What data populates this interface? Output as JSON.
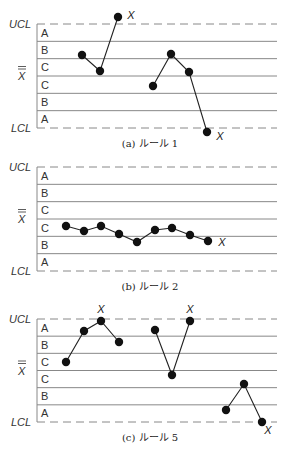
{
  "axis_labels": {
    "ucl": "UCL",
    "center": "X",
    "lcl": "LCL"
  },
  "zones": [
    "A",
    "B",
    "C",
    "C",
    "B",
    "A"
  ],
  "colors": {
    "line": "#888888",
    "point": "#111111",
    "connector": "#222222",
    "text": "#333333"
  },
  "chart_data": [
    {
      "type": "line",
      "title": "(a) ルール 1",
      "caption": "(a)  ルール 1",
      "top": 24,
      "bottom": 128,
      "groups": [
        [
          [
            82,
            55
          ],
          [
            100,
            71
          ],
          [
            118,
            17
          ]
        ],
        [
          [
            153,
            86
          ],
          [
            171,
            54
          ],
          [
            189,
            72
          ],
          [
            207,
            132
          ]
        ]
      ],
      "x_marks": [
        [
          131,
          19
        ],
        [
          220,
          140
        ]
      ]
    },
    {
      "type": "line",
      "title": "(b) ルール 2",
      "caption": "(b)  ルール 2",
      "top": 167,
      "bottom": 271,
      "groups": [
        [
          [
            66,
            226
          ],
          [
            84,
            231
          ],
          [
            101,
            226
          ],
          [
            119,
            234
          ],
          [
            137,
            242
          ],
          [
            155,
            230
          ],
          [
            172,
            228
          ],
          [
            190,
            235
          ],
          [
            208,
            241
          ]
        ]
      ],
      "x_marks": [
        [
          222,
          246
        ]
      ]
    },
    {
      "type": "line",
      "title": "(c) ルール 5",
      "caption": "(c)  ルール 5",
      "top": 319,
      "bottom": 422,
      "groups": [
        [
          [
            66,
            362
          ],
          [
            84,
            331
          ],
          [
            101,
            321
          ],
          [
            119,
            342
          ]
        ],
        [
          [
            155,
            330
          ],
          [
            172,
            375
          ],
          [
            190,
            321
          ]
        ],
        [
          [
            226,
            410
          ],
          [
            244,
            384
          ],
          [
            262,
            422
          ]
        ]
      ],
      "x_marks": [
        [
          101,
          313
        ],
        [
          190,
          313
        ],
        [
          268,
          434
        ]
      ]
    }
  ]
}
